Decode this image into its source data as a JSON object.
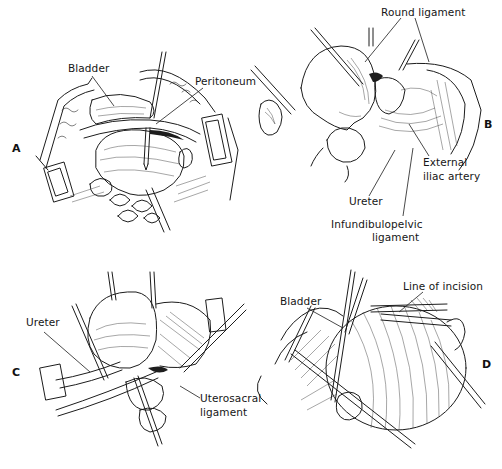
{
  "figure": {
    "panels": [
      {
        "id": "A",
        "letter": "A",
        "labels": {
          "bladder": "Bladder",
          "peritoneum": "Peritoneum"
        }
      },
      {
        "id": "B",
        "letter": "B",
        "labels": {
          "round_ligament": "Round ligament",
          "external_iliac_line1": "External",
          "external_iliac_line2": "iliac artery",
          "ureter": "Ureter",
          "infundibulopelvic_line1": "Infundibulopelvic",
          "infundibulopelvic_line2": "ligament"
        }
      },
      {
        "id": "C",
        "letter": "C",
        "labels": {
          "ureter": "Ureter",
          "uterosacral_line1": "Uterosacral",
          "uterosacral_line2": "ligament"
        }
      },
      {
        "id": "D",
        "letter": "D",
        "labels": {
          "bladder": "Bladder",
          "line_of_incision": "Line of incision"
        }
      }
    ]
  }
}
